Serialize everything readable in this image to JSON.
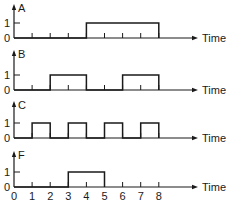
{
  "chart_data": {
    "type": "timing-diagram",
    "title": "",
    "xlabel": "Time",
    "x_ticks": [
      "0",
      "1",
      "2",
      "3",
      "4",
      "5",
      "6",
      "7",
      "8"
    ],
    "xlim": [
      0,
      8
    ],
    "y_ticks": [
      "0",
      "1"
    ],
    "signals": [
      {
        "name": "A",
        "levels": [
          0,
          0,
          0,
          0,
          1,
          1,
          1,
          1
        ],
        "pulses": [
          [
            4,
            8
          ]
        ]
      },
      {
        "name": "B",
        "levels": [
          0,
          0,
          1,
          1,
          0,
          0,
          1,
          1
        ],
        "pulses": [
          [
            2,
            4
          ],
          [
            6,
            8
          ]
        ]
      },
      {
        "name": "C",
        "levels": [
          0,
          1,
          0,
          1,
          0,
          1,
          0,
          1
        ],
        "pulses": [
          [
            1,
            2
          ],
          [
            3,
            4
          ],
          [
            5,
            6
          ],
          [
            7,
            8
          ]
        ]
      },
      {
        "name": "F",
        "levels": [
          0,
          0,
          0,
          1,
          1,
          0,
          0,
          0
        ],
        "pulses": [
          [
            3,
            5
          ]
        ]
      }
    ]
  },
  "layout": {
    "origin_x": 14,
    "unit_px": 18.1,
    "axis_end_x": 198,
    "high_offset": 15,
    "baselines": [
      38,
      90,
      138,
      187
    ],
    "axis_tops": [
      4,
      50,
      101,
      151
    ],
    "stroke_color": "#1a1a1a"
  }
}
